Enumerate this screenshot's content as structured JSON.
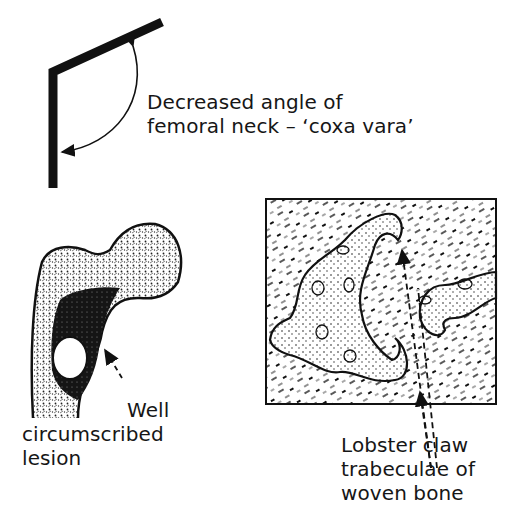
{
  "figure": {
    "panels": [
      {
        "id": "coxa-vara-angle",
        "label_lines": [
          "Decreased angle of",
          "femoral neck – ‘coxa vara’"
        ]
      },
      {
        "id": "femur-lesion",
        "label_lines": [
          "Well",
          "circumscribed",
          "lesion"
        ]
      },
      {
        "id": "histology",
        "label_lines": [
          "Lobster claw",
          "trabeculae of",
          "woven bone"
        ]
      }
    ],
    "colors": {
      "ink": "#111111",
      "background": "#ffffff"
    }
  }
}
